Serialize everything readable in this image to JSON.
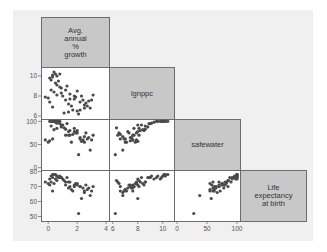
{
  "chart_data": {
    "type": "scatter",
    "subtype": "scatterplot-matrix-lower-half",
    "variables": [
      {
        "key": "popgrowth",
        "label": "Avg.\nannual\n%\ngrowth",
        "ticks": [
          0,
          2,
          4
        ],
        "range": [
          -0.5,
          4.2
        ]
      },
      {
        "key": "lgnppc",
        "label": "lgnppc",
        "ticks": [
          6,
          8,
          10
        ],
        "range": [
          5.7,
          10.9
        ]
      },
      {
        "key": "safewater",
        "label": "safewater",
        "ticks": [
          0,
          50,
          100
        ],
        "range": [
          -5,
          105
        ]
      },
      {
        "key": "lexp",
        "label": "Life\nexpectancy\nat birth",
        "ticks": [
          50,
          60,
          70,
          80
        ],
        "range": [
          47,
          81
        ]
      }
    ],
    "points": [
      [
        0.2,
        9.6,
        100,
        77
      ],
      [
        0.3,
        10.1,
        100,
        78
      ],
      [
        0.5,
        10.2,
        100,
        78
      ],
      [
        0.4,
        10.4,
        100,
        78
      ],
      [
        0.6,
        10.0,
        100,
        77
      ],
      [
        0.3,
        9.9,
        100,
        76
      ],
      [
        0.1,
        9.8,
        100,
        75
      ],
      [
        0.8,
        10.2,
        100,
        77
      ],
      [
        0.7,
        9.5,
        100,
        76
      ],
      [
        0.5,
        9.3,
        98,
        75
      ],
      [
        0.2,
        8.6,
        90,
        73
      ],
      [
        -0.2,
        7.9,
        60,
        73
      ],
      [
        0.0,
        7.8,
        55,
        72
      ],
      [
        0.1,
        7.4,
        58,
        71
      ],
      [
        0.3,
        6.9,
        62,
        67
      ],
      [
        0.4,
        8.4,
        82,
        72
      ],
      [
        0.6,
        8.1,
        85,
        74
      ],
      [
        0.9,
        8.8,
        88,
        76
      ],
      [
        1.0,
        8.0,
        92,
        75
      ],
      [
        1.2,
        7.6,
        70,
        71
      ],
      [
        1.3,
        9.0,
        95,
        76
      ],
      [
        1.4,
        7.2,
        78,
        69
      ],
      [
        1.5,
        8.2,
        80,
        73
      ],
      [
        1.6,
        7.0,
        55,
        68
      ],
      [
        1.7,
        6.6,
        72,
        67
      ],
      [
        1.8,
        7.7,
        85,
        70
      ],
      [
        1.9,
        7.9,
        75,
        72
      ],
      [
        2.0,
        8.5,
        80,
        71
      ],
      [
        2.1,
        6.2,
        28,
        52
      ],
      [
        2.2,
        7.4,
        65,
        70
      ],
      [
        2.3,
        8.0,
        57,
        62
      ],
      [
        2.4,
        7.6,
        60,
        69
      ],
      [
        2.5,
        6.8,
        67,
        66
      ],
      [
        2.6,
        7.3,
        75,
        71
      ],
      [
        2.7,
        7.0,
        62,
        68
      ],
      [
        2.8,
        7.5,
        65,
        69
      ],
      [
        2.9,
        6.8,
        38,
        64
      ],
      [
        3.0,
        7.6,
        60,
        67
      ],
      [
        3.1,
        8.1,
        70,
        70
      ],
      [
        1.1,
        6.3,
        86,
        74
      ],
      [
        0.9,
        8.3,
        92,
        76
      ],
      [
        1.5,
        7.7,
        70,
        70
      ],
      [
        2.0,
        6.5,
        75,
        72
      ],
      [
        0.6,
        9.1,
        96,
        77
      ],
      [
        1.2,
        8.6,
        83,
        73
      ],
      [
        2.5,
        7.1,
        55,
        67
      ],
      [
        1.8,
        8.0,
        78,
        71
      ],
      [
        0.8,
        8.9,
        95,
        76
      ],
      [
        1.4,
        6.4,
        70,
        73
      ],
      [
        2.2,
        6.6,
        62,
        70
      ]
    ]
  },
  "layout": {
    "panel_x": [
      41,
      109,
      174,
      240,
      306
    ],
    "panel_y": [
      17,
      67,
      119,
      170,
      221
    ],
    "point_color": "#4a4a4a",
    "diag_fill": "#c8c8c8",
    "frame_color": "#6b6b6b"
  }
}
